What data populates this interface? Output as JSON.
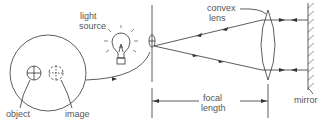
{
  "diagram": {
    "labels": {
      "light_source_1": "light",
      "light_source_2": "source",
      "convex_lens_1": "convex",
      "convex_lens_2": "lens",
      "focal_length_1": "focal",
      "focal_length_2": "length",
      "mirror": "mirror",
      "object": "object",
      "image": "image"
    },
    "colors": {
      "stroke": "#333333",
      "text": "#555555"
    }
  }
}
